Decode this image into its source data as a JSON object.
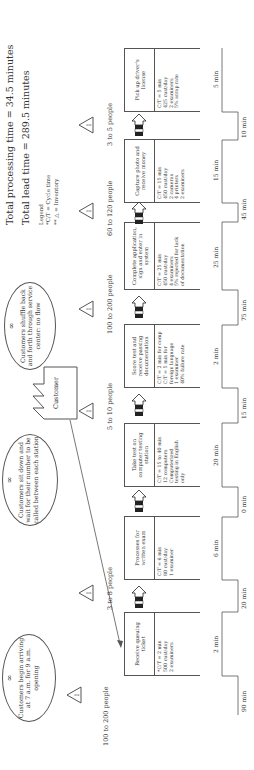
{
  "summary": {
    "processing_time": "Total processing time = 34.5 minutes",
    "lead_time": "Total lead time = 289.5 minutes"
  },
  "legend": {
    "title": "Legend",
    "ct": "*C/T = Cycle time",
    "inventory": "** △ = Inventory"
  },
  "customer": {
    "label": "Customer"
  },
  "bubbles": [
    {
      "text": "Customers begin arriving at 7 a.m. for 9 a.m. opening"
    },
    {
      "text": "Customers sit down and wait for their number to be called between each station"
    },
    {
      "text": "Customers shuffle back and forth through service center: no flow"
    }
  ],
  "processes": [
    {
      "name": "Receive queuing ticket",
      "data": [
        "*C/T = 2 min",
        "500 cust/day",
        "2 examiners"
      ]
    },
    {
      "name": "Processes for written exam",
      "data": [
        "C/T = 6 min",
        "80 cust/day",
        "1 examiner"
      ]
    },
    {
      "name": "Take test on computer testing station",
      "data": [
        "C/T = 15 to 40 min",
        "12 computers",
        "Computerized",
        "testing in English",
        "only"
      ]
    },
    {
      "name": "Score test and receive passing documentation",
      "data": [
        "C/T = 2 min for comp",
        "C/T = 5 min for",
        "foreign language",
        "1 examiner",
        "40% failure rate"
      ]
    },
    {
      "name": "Complete application, sign and enter in system",
      "data": [
        "C/T = 25 min",
        "450 cust/day",
        "4 examiners",
        "5% rejected for lack",
        "of documentation"
      ]
    },
    {
      "name": "Capture photo and receive money",
      "data": [
        "C/T = 15 min",
        "450 cust/day",
        "2 cameras",
        "4 printers",
        "2 examiners"
      ]
    },
    {
      "name": "Pick up driver's license",
      "data": [
        "C/T = 5 min",
        "425 cust/day",
        "2 examiners",
        "5% scrap rate"
      ]
    }
  ],
  "inventories": [
    {
      "label": "100 to 200 people",
      "symbol": "I"
    },
    {
      "label": "3 to 8 people",
      "symbol": "I"
    },
    {
      "label": "5 to 10 people",
      "symbol": "I"
    },
    {
      "label": "100 to 200 people",
      "symbol": "I"
    },
    {
      "label": "60 to 120 people",
      "symbol": "I"
    },
    {
      "label": "3 to 5 people",
      "symbol": "I"
    }
  ],
  "timeline": {
    "wait": [
      "90 min",
      "20 min",
      "0 min",
      "15 min",
      "75 min",
      "45 min",
      "10 min"
    ],
    "process": [
      "2 min",
      "6 min",
      "20 min",
      "2 min",
      "25 min",
      "15 min",
      "5 min"
    ]
  },
  "colors": {
    "line": "#555555",
    "text": "#333333",
    "background": "#ffffff"
  }
}
